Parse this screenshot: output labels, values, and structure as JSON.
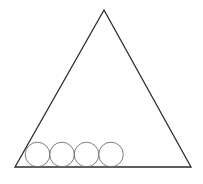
{
  "canvas": {
    "width": 203,
    "height": 184,
    "background": "#ffffff"
  },
  "triangle": {
    "stroke": "#2a2a2a",
    "stroke_width": 1.3,
    "vertices": {
      "apex": [
        104,
        10
      ],
      "bottom_left": [
        15,
        167
      ],
      "bottom_right": [
        191,
        167
      ]
    }
  },
  "circles": {
    "stroke": "#6e6e6e",
    "stroke_width": 0.9,
    "radius": 12.3,
    "count": 4,
    "items": [
      {
        "cx": 37.5,
        "cy": 154.5
      },
      {
        "cx": 62,
        "cy": 154.5
      },
      {
        "cx": 86.5,
        "cy": 154.5
      },
      {
        "cx": 111,
        "cy": 154.5
      }
    ]
  }
}
